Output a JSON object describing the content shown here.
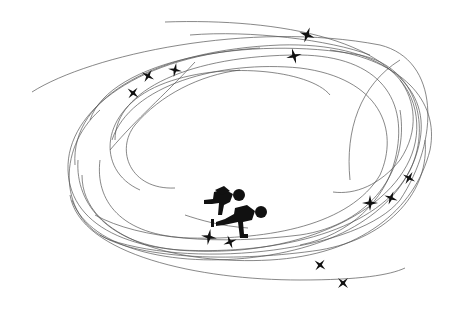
{
  "illustration": {
    "subject": "speed skating pictogram with orbital track lines",
    "icon": "speed-skaters-icon",
    "colors": {
      "background": "#ffffff",
      "lines": "#555555",
      "figures": "#111111"
    },
    "sparkles": [
      {
        "x": 307,
        "y": 35,
        "r": 7
      },
      {
        "x": 294,
        "y": 56,
        "r": 7
      },
      {
        "x": 175,
        "y": 70,
        "r": 6
      },
      {
        "x": 148,
        "y": 76,
        "r": 6
      },
      {
        "x": 133,
        "y": 93,
        "r": 6
      },
      {
        "x": 409,
        "y": 178,
        "r": 6
      },
      {
        "x": 391,
        "y": 198,
        "r": 6
      },
      {
        "x": 370,
        "y": 203,
        "r": 7
      },
      {
        "x": 209,
        "y": 237,
        "r": 7
      },
      {
        "x": 230,
        "y": 242,
        "r": 6
      },
      {
        "x": 320,
        "y": 265,
        "r": 6
      },
      {
        "x": 343,
        "y": 283,
        "r": 6
      }
    ]
  }
}
